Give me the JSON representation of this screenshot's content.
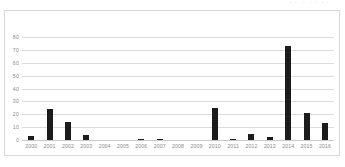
{
  "top_caption": "・・ ・ ・・・・",
  "chart_data": {
    "type": "bar",
    "title": "",
    "xlabel": "",
    "ylabel": "",
    "categories": [
      "2000",
      "2001",
      "2002",
      "2003",
      "2004",
      "2005",
      "2006",
      "2007",
      "2008",
      "2009",
      "2010",
      "2011",
      "2012",
      "2013",
      "2014",
      "2015",
      "2016"
    ],
    "values": [
      3,
      24,
      14,
      4,
      0,
      0,
      1,
      1,
      0,
      0,
      25,
      1,
      5,
      2,
      73,
      21,
      13
    ],
    "ylim": [
      0,
      80
    ],
    "ytick_values": [
      80,
      70,
      60,
      50,
      40,
      30,
      20,
      10,
      0
    ],
    "ytick_labels": [
      "80",
      "70",
      "60",
      "50",
      "40",
      "30",
      "20",
      "10",
      "0"
    ],
    "grid": true,
    "legend": false,
    "series_color": "#1c1c1c",
    "gridline_color": "#dcdcdc",
    "plot_background": "#ffffff",
    "border_color": "#d8d8d8"
  }
}
